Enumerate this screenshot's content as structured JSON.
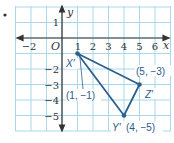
{
  "figure": {
    "bullet": "•",
    "axes": {
      "x_label": "y_placeholder",
      "xlabel": "x",
      "ylabel": "y",
      "origin_label": "O",
      "x_ticks": [
        "−2",
        "1",
        "2",
        "3",
        "4",
        "5",
        "6"
      ],
      "y_ticks": [
        "1",
        "−2",
        "−3",
        "−4",
        "−5"
      ],
      "x_range": [
        -3,
        7
      ],
      "y_range": [
        -6,
        2
      ]
    },
    "points": [
      {
        "name": "X′",
        "coord_label": "(1, −1)",
        "x": 1,
        "y": -1
      },
      {
        "name": "Y′",
        "coord_label": "(4, −5)",
        "x": 4,
        "y": -5
      },
      {
        "name": "Z′",
        "coord_label": "(5, −3)",
        "x": 5,
        "y": -3
      }
    ],
    "colors": {
      "grid": "#9fd3e6",
      "axis": "#333333",
      "triangle": "#2e5f8f",
      "background": "#ffffff"
    }
  }
}
